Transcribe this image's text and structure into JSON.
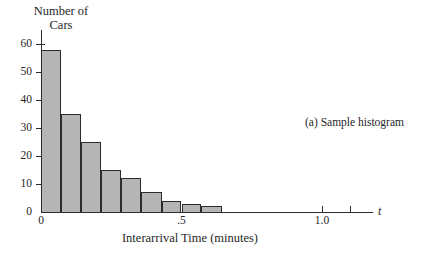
{
  "figure": {
    "caption": "(a) Sample histogram",
    "axis_variable": "t"
  },
  "chart_data": {
    "type": "bar",
    "title": "",
    "subtitle": "",
    "ylabel": "Number of\nCars",
    "xlabel": "Interarrival Time (minutes)",
    "annotations": [
      "(a) Sample histogram"
    ],
    "legend": [],
    "grid": false,
    "bin_width": 0.0714,
    "xlim": [
      0,
      1.2
    ],
    "ylim": [
      0,
      62
    ],
    "x_ticks": [
      {
        "value": 0,
        "label": "0"
      },
      {
        "value": 0.5,
        "label": ".5"
      },
      {
        "value": 1.0,
        "label": "1.0"
      },
      {
        "value": 1.1,
        "label": ""
      }
    ],
    "y_ticks": [
      {
        "value": 0,
        "label": "0"
      },
      {
        "value": 10,
        "label": "10"
      },
      {
        "value": 20,
        "label": "20"
      },
      {
        "value": 30,
        "label": "30"
      },
      {
        "value": 40,
        "label": "40"
      },
      {
        "value": 50,
        "label": "50"
      },
      {
        "value": 60,
        "label": "60"
      }
    ],
    "bins": [
      {
        "x0": 0.0,
        "x1": 0.071,
        "value": 58
      },
      {
        "x0": 0.071,
        "x1": 0.143,
        "value": 35
      },
      {
        "x0": 0.143,
        "x1": 0.214,
        "value": 25
      },
      {
        "x0": 0.214,
        "x1": 0.286,
        "value": 15
      },
      {
        "x0": 0.286,
        "x1": 0.357,
        "value": 12
      },
      {
        "x0": 0.357,
        "x1": 0.429,
        "value": 7
      },
      {
        "x0": 0.429,
        "x1": 0.5,
        "value": 4
      },
      {
        "x0": 0.5,
        "x1": 0.571,
        "value": 3
      },
      {
        "x0": 0.571,
        "x1": 0.643,
        "value": 2
      }
    ],
    "categories": [
      "0-.071",
      ".071-.143",
      ".143-.214",
      ".214-.286",
      ".286-.357",
      ".357-.429",
      ".429-.5",
      ".5-.571",
      ".571-.643"
    ],
    "values": [
      58,
      35,
      25,
      15,
      12,
      7,
      4,
      3,
      2
    ],
    "colors": {
      "bar_fill": "#b5b5b5",
      "bar_stroke": "#2b2b2b",
      "axis": "#2b2b2b",
      "text": "#262626",
      "background": "#ffffff"
    }
  }
}
